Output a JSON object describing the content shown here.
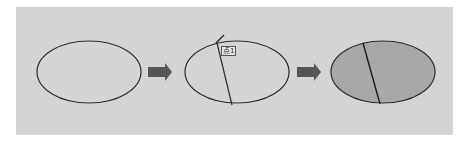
{
  "diagram": {
    "colors": {
      "background": "#ffffff",
      "panel": "#d4d4d4",
      "outline": "#2b2b2b",
      "arrow": "#555555",
      "fill": "#a8a8a8"
    },
    "steps": [
      {
        "id": "step-1",
        "shape": "ellipse",
        "filled": false
      },
      {
        "id": "step-2",
        "shape": "ellipse",
        "filled": false,
        "divider": true,
        "label": "点1"
      },
      {
        "id": "step-3",
        "shape": "ellipse",
        "filled": true,
        "divider": true
      }
    ],
    "arrows": 2
  }
}
